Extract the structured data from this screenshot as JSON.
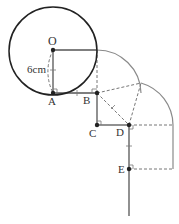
{
  "diagram": {
    "points": {
      "O": {
        "label": "O",
        "x": 53,
        "y": 50
      },
      "A": {
        "label": "A",
        "x": 53,
        "y": 93
      },
      "B": {
        "label": "B",
        "x": 97,
        "y": 93
      },
      "C": {
        "label": "C",
        "x": 97,
        "y": 125
      },
      "D": {
        "label": "D",
        "x": 129,
        "y": 125
      },
      "E": {
        "label": "E",
        "x": 129,
        "y": 169
      }
    },
    "radius_label": "6cm",
    "colors": {
      "circle": "#222222",
      "arc": "#888888",
      "line": "#555555",
      "dashed": "#777777"
    }
  }
}
